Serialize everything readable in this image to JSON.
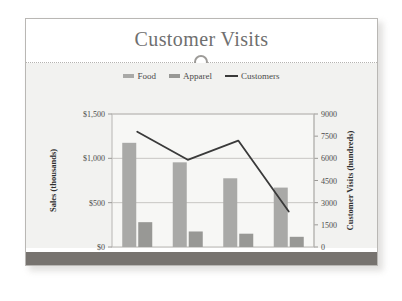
{
  "slide": {
    "title": "Customer Visits",
    "divider_ornament": "circle-ring"
  },
  "chart_data": {
    "type": "bar",
    "title": "Customer Visits",
    "categories": [
      "2007",
      "2006",
      "2005",
      "2004"
    ],
    "xlabel": "",
    "ylabel": "Sales (thousands)",
    "y2label": "Customer Visits (hundreds)",
    "ylim": [
      0,
      1500
    ],
    "y2lim": [
      0,
      9000
    ],
    "yticks": [
      0,
      500,
      1000,
      1500
    ],
    "ytick_labels": [
      "$0",
      "$500",
      "$1,000",
      "$1,500"
    ],
    "y2ticks": [
      0,
      1500,
      3000,
      4500,
      6000,
      7500,
      9000
    ],
    "y2tick_labels": [
      "0",
      "1500",
      "3000",
      "4500",
      "6000",
      "7500",
      "9000"
    ],
    "grid": true,
    "legend_position": "top",
    "series": [
      {
        "name": "Food",
        "type": "bar",
        "axis": "left",
        "color": "#a9a9a7",
        "values": [
          1175,
          955,
          775,
          670
        ]
      },
      {
        "name": "Apparel",
        "type": "bar",
        "axis": "left",
        "color": "#989895",
        "values": [
          280,
          175,
          150,
          115
        ]
      },
      {
        "name": "Customers",
        "type": "line",
        "axis": "right",
        "color": "#3a3a3a",
        "values": [
          7800,
          5900,
          7200,
          2400
        ]
      }
    ]
  }
}
